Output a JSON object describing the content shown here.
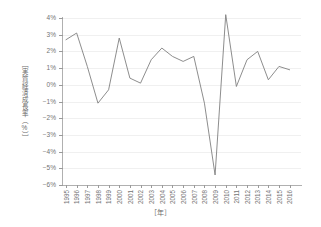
{
  "axis": {
    "y_title": "［実質経済成長率（%）］",
    "x_title": "［年］",
    "y_tick_labels": [
      "4%",
      "3%",
      "2%",
      "1%",
      "0%",
      "−1%",
      "−2%",
      "−3%",
      "−4%",
      "−5%",
      "−6%"
    ],
    "y_tick_values": [
      4,
      3,
      2,
      1,
      0,
      -1,
      -2,
      -3,
      -4,
      -5,
      -6
    ]
  },
  "style": {
    "line_color": "#808080",
    "grid_color": "#f0f0f0",
    "axis_color": "#b0b0b0",
    "text_color": "#737373",
    "background": "#ffffff"
  },
  "chart_data": {
    "type": "line",
    "title": "",
    "subtitle": "",
    "xlabel": "［年］",
    "ylabel": "［実質経済成長率（%）］",
    "ylim": [
      -6,
      4
    ],
    "ytick_step": 1,
    "grid": true,
    "legend": "none",
    "categories": [
      "1995",
      "1996",
      "1997",
      "1998",
      "1999",
      "2000",
      "2001",
      "2002",
      "2003",
      "2004",
      "2005",
      "2006",
      "2007",
      "2008",
      "2009",
      "2010",
      "2011",
      "2012",
      "2013",
      "2014",
      "2015",
      "2016"
    ],
    "series": [
      {
        "name": "実質経済成長率",
        "values": [
          2.7,
          3.1,
          1.1,
          -1.1,
          -0.3,
          2.8,
          0.4,
          0.1,
          1.5,
          2.2,
          1.7,
          1.4,
          1.7,
          -1.1,
          -5.4,
          4.2,
          -0.1,
          1.5,
          2.0,
          0.3,
          1.1,
          0.9
        ]
      }
    ]
  }
}
